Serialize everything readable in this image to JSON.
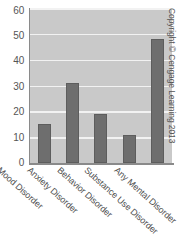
{
  "chart_data": {
    "type": "bar",
    "title": "",
    "subtitle": "",
    "xlabel": "",
    "ylabel": "",
    "categories": [
      "Mood Disorder",
      "Anxiety Disorder",
      "Behavior Disorder",
      "Substance Use Disorder",
      "Any Mental Disorder"
    ],
    "values": [
      15,
      31,
      19,
      11,
      48
    ],
    "ylim": [
      0,
      60
    ],
    "ytick_labels": [
      "60",
      "50",
      "40",
      "30",
      "20",
      "10",
      "0"
    ],
    "ytick_values": [
      60,
      50,
      40,
      30,
      20,
      10,
      0
    ],
    "grid": true,
    "legend": null,
    "annotations": []
  },
  "figure": {
    "copyright": "Copyright © Cengage Learning 2013",
    "plot_background_color": "#c9c9c9",
    "gridline_color": "#f2f2f2",
    "bar_color": "#6e6e6e",
    "axis_color": "#8a8a8a",
    "text_color": "#4f4f4f"
  }
}
